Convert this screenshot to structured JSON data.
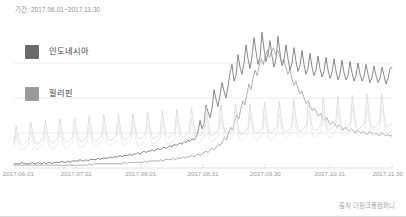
{
  "header": {
    "period_label": "기간: 2017.06.01~2017.11.30"
  },
  "footer": {
    "source_label": "출처 더핑크퐁컴퍼니"
  },
  "legend": {
    "items": [
      {
        "label": "인도네시아",
        "color": "#6b6b6b",
        "swatch_name": "legend-swatch-indonesia"
      },
      {
        "label": "필리핀",
        "color": "#9a9a9a",
        "swatch_name": "legend-swatch-philippines"
      }
    ]
  },
  "chart_data": {
    "type": "line",
    "title": "",
    "subtitle": "",
    "xlabel": "",
    "ylabel": "",
    "grid": true,
    "gridlines_y": [
      25,
      50,
      75
    ],
    "legend_position": "inside-top-left",
    "xlim": [
      0,
      182
    ],
    "ylim": [
      0,
      100
    ],
    "x_tick_labels": [
      "2017.06.01",
      "2017.07.01",
      "2017.08.01",
      "2017.08.31",
      "2017.09.30",
      "2017.10.31",
      "2017.11.30"
    ],
    "x_tick_positions": [
      0,
      30,
      61,
      91,
      121,
      152,
      182
    ],
    "colors": {
      "indonesia": "#6b6b6b",
      "philippines": "#9a9a9a",
      "series_c": "#d2d2d2",
      "series_d": "#e0e0e0",
      "gridline": "#ececec",
      "axis": "#e2e2e2"
    },
    "series": [
      {
        "name": "인도네시아",
        "color": "#6b6b6b",
        "width": 0.8,
        "values": [
          3,
          3,
          3,
          3,
          4,
          3,
          3,
          3,
          3,
          4,
          3,
          3,
          4,
          3,
          3,
          4,
          3,
          4,
          4,
          3,
          4,
          4,
          4,
          4,
          5,
          4,
          4,
          5,
          4,
          5,
          5,
          5,
          5,
          6,
          5,
          5,
          6,
          5,
          6,
          6,
          6,
          6,
          7,
          6,
          7,
          7,
          7,
          7,
          8,
          7,
          8,
          8,
          8,
          9,
          8,
          9,
          9,
          9,
          10,
          9,
          10,
          10,
          11,
          10,
          11,
          12,
          11,
          12,
          12,
          13,
          12,
          13,
          14,
          13,
          14,
          15,
          14,
          15,
          16,
          15,
          17,
          16,
          17,
          18,
          17,
          19,
          18,
          20,
          19,
          21,
          20,
          22,
          26,
          34,
          28,
          31,
          45,
          40,
          36,
          42,
          56,
          49,
          44,
          52,
          61,
          55,
          50,
          58,
          68,
          74,
          62,
          66,
          81,
          72,
          67,
          75,
          88,
          78,
          71,
          80,
          93,
          83,
          74,
          79,
          97,
          85,
          76,
          82,
          91,
          80,
          72,
          78,
          94,
          82,
          73,
          77,
          88,
          78,
          70,
          75,
          86,
          76,
          69,
          73,
          84,
          74,
          67,
          71,
          82,
          72,
          66,
          70,
          80,
          71,
          65,
          69,
          79,
          70,
          64,
          68,
          78,
          69,
          63,
          67,
          77,
          68,
          63,
          66,
          76,
          68,
          62,
          66,
          75,
          67,
          62,
          65,
          74,
          67,
          61,
          65,
          73,
          66,
          61,
          64,
          72,
          66,
          60,
          64,
          71,
          72
        ]
      },
      {
        "name": "필리핀",
        "color": "#9a9a9a",
        "width": 0.8,
        "values": [
          2,
          2,
          2,
          2,
          2,
          2,
          2,
          2,
          2,
          2,
          2,
          2,
          2,
          2,
          2,
          2,
          2,
          2,
          2,
          2,
          2,
          2,
          2,
          2,
          2,
          2,
          2,
          2,
          2,
          2,
          2,
          2,
          2,
          2,
          2,
          2,
          2,
          3,
          2,
          3,
          3,
          3,
          3,
          3,
          3,
          3,
          3,
          3,
          3,
          3,
          3,
          3,
          3,
          3,
          4,
          3,
          4,
          4,
          4,
          4,
          4,
          4,
          4,
          4,
          5,
          4,
          5,
          5,
          5,
          5,
          5,
          5,
          6,
          5,
          6,
          6,
          6,
          6,
          7,
          6,
          7,
          7,
          7,
          8,
          7,
          8,
          8,
          9,
          8,
          9,
          10,
          9,
          10,
          11,
          12,
          11,
          13,
          14,
          13,
          15,
          17,
          16,
          19,
          22,
          20,
          25,
          29,
          27,
          33,
          38,
          35,
          42,
          48,
          45,
          53,
          60,
          56,
          64,
          70,
          66,
          73,
          78,
          74,
          80,
          84,
          79,
          83,
          86,
          81,
          84,
          80,
          75,
          78,
          72,
          67,
          70,
          64,
          59,
          62,
          57,
          53,
          55,
          50,
          46,
          48,
          44,
          41,
          43,
          40,
          37,
          39,
          36,
          34,
          36,
          33,
          31,
          33,
          31,
          29,
          31,
          29,
          27,
          29,
          28,
          26,
          28,
          27,
          25,
          27,
          26,
          25,
          26,
          25,
          24,
          26,
          25,
          24,
          25,
          24,
          23,
          25,
          24,
          23,
          24,
          23,
          23
        ]
      },
      {
        "name": "series-c",
        "color": "#d2d2d2",
        "width": 0.7,
        "values": [
          18,
          30,
          22,
          17,
          16,
          17,
          19,
          20,
          33,
          24,
          18,
          17,
          18,
          20,
          21,
          34,
          25,
          19,
          18,
          18,
          20,
          22,
          35,
          26,
          19,
          18,
          19,
          21,
          22,
          36,
          27,
          20,
          19,
          19,
          21,
          23,
          37,
          27,
          20,
          19,
          20,
          22,
          23,
          38,
          28,
          21,
          20,
          20,
          22,
          24,
          38,
          28,
          21,
          20,
          21,
          23,
          24,
          39,
          29,
          22,
          21,
          21,
          23,
          25,
          40,
          30,
          22,
          21,
          22,
          24,
          25,
          41,
          30,
          23,
          22,
          22,
          24,
          26,
          42,
          31,
          23,
          22,
          23,
          25,
          26,
          43,
          32,
          24,
          23,
          23,
          25,
          27,
          44,
          32,
          24,
          23,
          24,
          26,
          27,
          45,
          33,
          25,
          24,
          24,
          26,
          28,
          46,
          34,
          25,
          24,
          25,
          27,
          28,
          46,
          34,
          26,
          25,
          25,
          27,
          29,
          47,
          35,
          26,
          25,
          26,
          28,
          29,
          48,
          35,
          27,
          26,
          26,
          28,
          30,
          49,
          36,
          27,
          26,
          27,
          29,
          30,
          49,
          37,
          28,
          27,
          27,
          29,
          31,
          50,
          37,
          28,
          27,
          28,
          30,
          31,
          51,
          38,
          29,
          28,
          28,
          30,
          32,
          52,
          38,
          29,
          28,
          29,
          31,
          32,
          53,
          39,
          30,
          29,
          29,
          31,
          33,
          53,
          40,
          30,
          29,
          30,
          32
        ]
      },
      {
        "name": "series-d",
        "color": "#e4e4e4",
        "width": 0.7,
        "values": [
          14,
          24,
          17,
          13,
          13,
          14,
          15,
          16,
          26,
          19,
          14,
          13,
          14,
          16,
          17,
          27,
          20,
          15,
          14,
          14,
          16,
          17,
          28,
          20,
          15,
          14,
          15,
          17,
          18,
          29,
          21,
          16,
          15,
          15,
          17,
          18,
          29,
          22,
          16,
          15,
          16,
          18,
          19,
          30,
          22,
          17,
          16,
          16,
          18,
          19,
          31,
          23,
          17,
          16,
          17,
          19,
          20,
          32,
          23,
          17,
          16,
          17,
          19,
          20,
          32,
          24,
          18,
          17,
          18,
          20,
          21,
          33,
          24,
          18,
          17,
          18,
          20,
          21,
          34,
          25,
          19,
          18,
          19,
          21,
          22,
          35,
          26,
          19,
          18,
          19,
          21,
          22,
          35,
          26,
          20,
          19,
          20,
          22,
          23,
          36,
          27,
          20,
          19,
          20,
          22,
          23,
          37,
          27,
          20,
          19,
          20,
          22,
          24,
          38,
          28,
          21,
          20,
          21,
          23,
          24,
          38,
          28,
          21,
          20,
          21,
          23,
          25,
          39,
          29,
          22,
          21,
          22,
          24,
          25,
          40,
          30,
          22,
          21,
          22,
          24,
          26,
          41,
          30,
          23,
          22,
          23,
          25,
          26,
          41,
          31,
          23,
          22,
          23,
          25,
          27,
          42,
          31,
          24,
          23,
          24,
          26,
          27,
          43,
          32,
          24,
          23,
          24,
          26,
          28,
          44,
          33,
          25,
          24,
          25,
          27,
          28,
          44,
          33,
          25,
          24,
          25,
          27
        ]
      }
    ]
  }
}
